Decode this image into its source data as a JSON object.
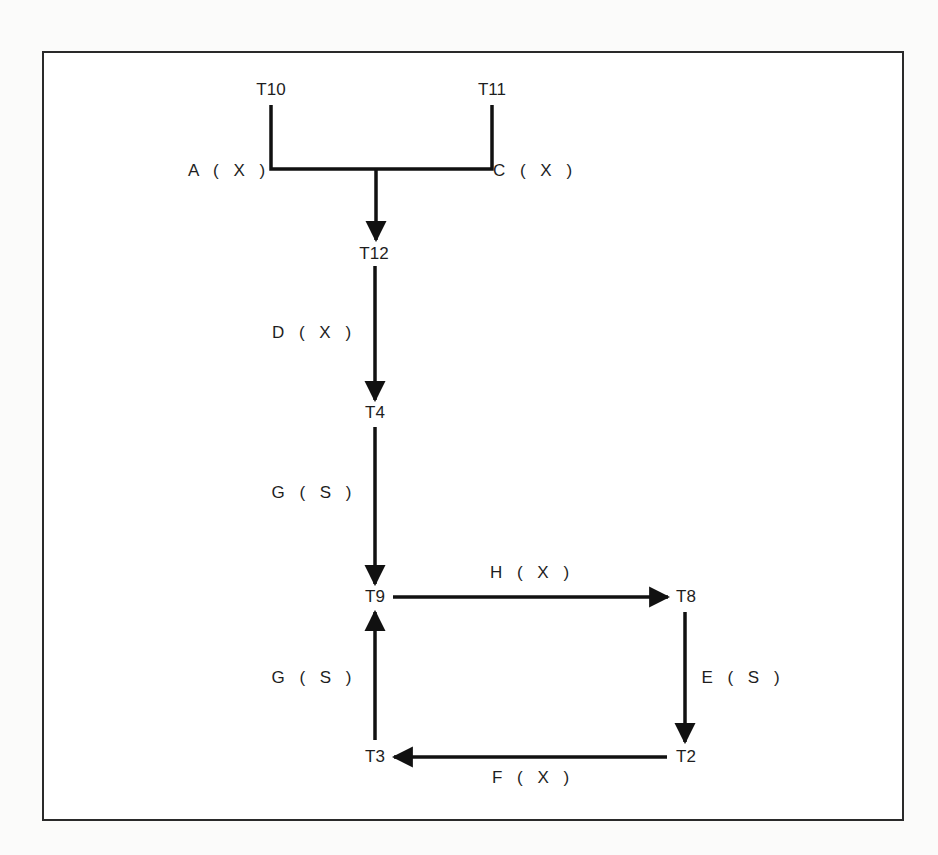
{
  "diagram": {
    "nodes": [
      {
        "id": "T10",
        "label": "T10",
        "x": 271,
        "y": 90
      },
      {
        "id": "T11",
        "label": "T11",
        "x": 492,
        "y": 90
      },
      {
        "id": "T12",
        "label": "T12",
        "x": 374,
        "y": 254
      },
      {
        "id": "T4",
        "label": "T4",
        "x": 375,
        "y": 413
      },
      {
        "id": "T9",
        "label": "T9",
        "x": 375,
        "y": 597
      },
      {
        "id": "T8",
        "label": "T8",
        "x": 686,
        "y": 597
      },
      {
        "id": "T2",
        "label": "T2",
        "x": 686,
        "y": 757
      },
      {
        "id": "T3",
        "label": "T3",
        "x": 375,
        "y": 757
      }
    ],
    "edges": [
      {
        "from": "T10",
        "to": "T12",
        "label": "A ( X )",
        "label_x": 229,
        "label_y": 171
      },
      {
        "from": "T11",
        "to": "T12",
        "label": "C ( X )",
        "label_x": 535,
        "label_y": 171
      },
      {
        "from": "T12",
        "to": "T4",
        "label": "D ( X )",
        "label_x": 314,
        "label_y": 333
      },
      {
        "from": "T4",
        "to": "T9",
        "label": "G ( S )",
        "label_x": 314,
        "label_y": 493
      },
      {
        "from": "T9",
        "to": "T8",
        "label": "H ( X )",
        "label_x": 532,
        "label_y": 573
      },
      {
        "from": "T8",
        "to": "T2",
        "label": "E ( S )",
        "label_x": 743,
        "label_y": 678
      },
      {
        "from": "T2",
        "to": "T3",
        "label": "F ( X )",
        "label_x": 533,
        "label_y": 778
      },
      {
        "from": "T3",
        "to": "T9",
        "label": "G ( S )",
        "label_x": 314,
        "label_y": 678
      }
    ]
  }
}
